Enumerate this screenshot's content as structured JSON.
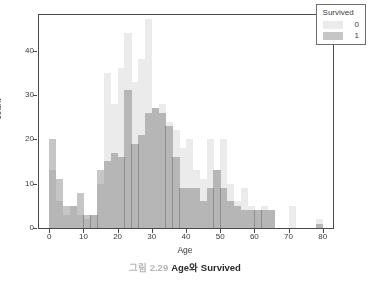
{
  "caption": {
    "number": "그림 2.29",
    "text": "Age와 Survived"
  },
  "legend": {
    "title": "Survived",
    "entries": [
      {
        "label": "0",
        "color": "#ebebeb"
      },
      {
        "label": "1",
        "color": "#c6c6c6"
      }
    ]
  },
  "colors": {
    "survived_0": "#ebebeb",
    "survived_1": "#c6c6c6",
    "overlap": "#c9c9c9",
    "frame": "#4a4a4a",
    "text": "#3a3a3a"
  },
  "chart_data": {
    "type": "bar",
    "subtype": "overlapping-histogram",
    "title": "",
    "xlabel": "Age",
    "ylabel": "count",
    "xlim": [
      -3,
      83
    ],
    "ylim": [
      0,
      48
    ],
    "xticks": [
      0,
      10,
      20,
      30,
      40,
      50,
      60,
      70,
      80
    ],
    "yticks": [
      0,
      10,
      20,
      30,
      40
    ],
    "grid": false,
    "legend_position": "top-right",
    "bin_width": 2,
    "bin_starts": [
      0,
      2,
      4,
      6,
      8,
      10,
      12,
      14,
      16,
      18,
      20,
      22,
      24,
      26,
      28,
      30,
      32,
      34,
      36,
      38,
      40,
      42,
      44,
      46,
      48,
      50,
      52,
      54,
      56,
      58,
      60,
      62,
      64,
      66,
      68,
      70,
      72,
      74,
      76,
      78,
      80
    ],
    "series": [
      {
        "name": "0",
        "color": "#ebebeb",
        "values": [
          13,
          6,
          3,
          5,
          3,
          2,
          3,
          10,
          35,
          28,
          36,
          44,
          33,
          38,
          47,
          27,
          28,
          24,
          22,
          18,
          20,
          13,
          11,
          20,
          13,
          20,
          10,
          6,
          9,
          5,
          4,
          5,
          4,
          0,
          0,
          5,
          0,
          0,
          0,
          2,
          0
        ]
      },
      {
        "name": "1",
        "color": "#c6c6c6",
        "values": [
          20,
          11,
          5,
          5,
          8,
          3,
          3,
          13,
          15,
          17,
          16,
          31,
          19,
          21,
          26,
          27,
          26,
          23,
          16,
          9,
          9,
          9,
          6,
          9,
          13,
          9,
          6,
          5,
          4,
          4,
          4,
          4,
          4,
          0,
          0,
          0,
          0,
          0,
          0,
          1,
          0
        ]
      }
    ]
  }
}
